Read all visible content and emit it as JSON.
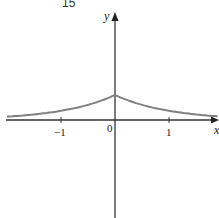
{
  "header_fragment": "15",
  "chart_data": {
    "type": "line",
    "title": "",
    "xlabel": "x",
    "ylabel": "y",
    "x_ticks": [
      -1,
      0,
      1
    ],
    "x_tick_labels": [
      "−1",
      "0",
      "1"
    ],
    "xlim": [
      -2.0,
      1.9
    ],
    "ylim": [
      -1.8,
      2.2
    ],
    "grid": false,
    "legend": null,
    "series": [
      {
        "name": "y = e^(-|x|) (approx.)",
        "color": "#808080",
        "x": [
          -2.0,
          -1.5,
          -1.0,
          -0.5,
          0,
          0.5,
          1.0,
          1.5,
          1.9
        ],
        "y": [
          0.14,
          0.22,
          0.37,
          0.61,
          1.0,
          0.61,
          0.37,
          0.22,
          0.15
        ]
      }
    ]
  }
}
